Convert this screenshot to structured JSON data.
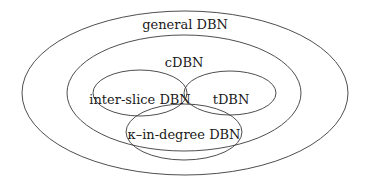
{
  "diagram": {
    "type": "euler-diagram",
    "stroke_color": "#3a3a3a",
    "sets": [
      {
        "id": "general",
        "label": "general DBN",
        "cx": 185,
        "cy": 93,
        "rx": 163,
        "ry": 82,
        "label_x": 185,
        "label_y": 24
      },
      {
        "id": "cdbn",
        "label": "cDBN",
        "cx": 184,
        "cy": 93,
        "rx": 117,
        "ry": 58,
        "label_x": 184,
        "label_y": 62
      },
      {
        "id": "inter-slice",
        "label": "inter-slice DBN",
        "cx": 140,
        "cy": 93,
        "rx": 47,
        "ry": 23,
        "label_x": 140,
        "label_y": 99
      },
      {
        "id": "tdbn",
        "label": "tDBN",
        "cx": 230,
        "cy": 93,
        "rx": 46,
        "ry": 22,
        "label_x": 231,
        "label_y": 99
      },
      {
        "id": "k-in-degree",
        "label": "κ–in-degree DBN",
        "cx": 184,
        "cy": 132,
        "rx": 58,
        "ry": 28,
        "label_x": 184,
        "label_y": 134
      }
    ]
  }
}
